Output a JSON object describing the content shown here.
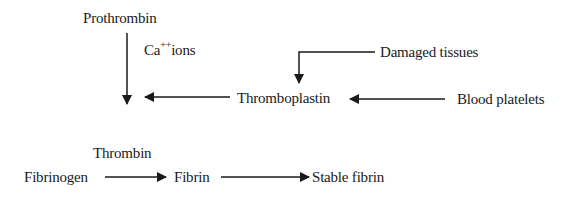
{
  "diagram": {
    "nodes": {
      "prothrombin": "Prothrombin",
      "ca_ions_base": "Ca",
      "ca_ions_sup": "++",
      "ca_ions_rest": "ions",
      "damaged_tissues": "Damaged tissues",
      "thromboplastin": "Thromboplastin",
      "blood_platelets": "Blood platelets",
      "thrombin": "Thrombin",
      "fibrinogen": "Fibrinogen",
      "fibrin": "Fibrin",
      "stable_fibrin": "Stable fibrin"
    },
    "edges": [
      {
        "from": "Prothrombin",
        "to": "Thrombin",
        "label": "Ca++ ions"
      },
      {
        "from": "Damaged tissues",
        "to": "Thromboplastin"
      },
      {
        "from": "Blood platelets",
        "to": "Thromboplastin"
      },
      {
        "from": "Thromboplastin",
        "to": "Prothrombin→Thrombin conversion"
      },
      {
        "from": "Fibrinogen",
        "to": "Fibrin",
        "label": "Thrombin"
      },
      {
        "from": "Fibrin",
        "to": "Stable fibrin"
      }
    ]
  }
}
